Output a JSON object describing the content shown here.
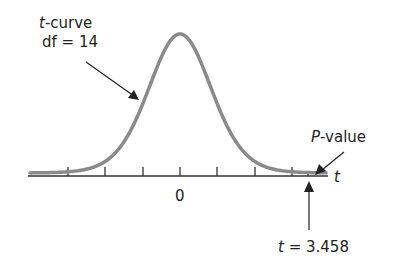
{
  "curve_label": {
    "italic": "t",
    "rest": "-curve"
  },
  "df_label": "df = 14",
  "pvalue_label": {
    "italic": "P",
    "rest": "-value"
  },
  "axis_label": "t",
  "zero_label": "0",
  "tstat_label": {
    "italic": "t",
    "rest": " = 3.458"
  },
  "colors": {
    "curve": "#8a8a8a",
    "axis": "#333333",
    "text": "#222222"
  },
  "chart_data": {
    "type": "line",
    "xlabel": "t",
    "distribution": "Student t",
    "df": 14,
    "t_statistic": 3.458,
    "tick_labels": [
      "0"
    ],
    "annotations": [
      "t-curve df = 14",
      "P-value",
      "t = 3.458"
    ]
  }
}
